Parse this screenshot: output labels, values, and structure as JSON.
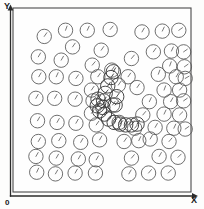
{
  "figure": {
    "title": "",
    "x_axis_label": "X",
    "y_axis_label": "Y",
    "origin_label": "0",
    "caption_partial": "",
    "colors": {
      "frame_stroke": "#4a4a4a",
      "axis_stroke": "#2b2b2b",
      "marker_stroke": "#555555",
      "cluster_stroke": "#3d3d3d",
      "background": "#fefefe"
    }
  },
  "chart_data": {
    "type": "scatter",
    "title": "",
    "xlabel": "X",
    "ylabel": "Y",
    "xlim": [
      0,
      100
    ],
    "ylim": [
      0,
      100
    ],
    "grid": false,
    "legend": null,
    "marker": "circle-with-orientation-hand",
    "marker_radius_px": 7.2,
    "points": [
      {
        "x": 13.9,
        "y": 88.3,
        "angle": 35
      },
      {
        "x": 27.2,
        "y": 92.0,
        "angle": 20
      },
      {
        "x": 40.8,
        "y": 92.0,
        "angle": 25
      },
      {
        "x": 55.1,
        "y": 92.5,
        "angle": 40
      },
      {
        "x": 75.0,
        "y": 91.0,
        "angle": 30
      },
      {
        "x": 87.7,
        "y": 91.5,
        "angle": 25
      },
      {
        "x": 98.0,
        "y": 92.0,
        "angle": 55
      },
      {
        "x": 31.6,
        "y": 82.0,
        "angle": 35
      },
      {
        "x": 49.5,
        "y": 80.0,
        "angle": 35
      },
      {
        "x": 10.2,
        "y": 76.0,
        "angle": 30
      },
      {
        "x": 24.5,
        "y": 74.0,
        "angle": 30
      },
      {
        "x": 43.9,
        "y": 71.0,
        "angle": 40
      },
      {
        "x": 82.1,
        "y": 79.0,
        "angle": 35
      },
      {
        "x": 93.4,
        "y": 79.5,
        "angle": 25
      },
      {
        "x": 101.0,
        "y": 79.0,
        "angle": 55
      },
      {
        "x": 68.4,
        "y": 75.0,
        "angle": 40
      },
      {
        "x": 92.3,
        "y": 70.5,
        "angle": 20
      },
      {
        "x": 101.5,
        "y": 70.0,
        "angle": 55
      },
      {
        "x": 10.5,
        "y": 64.0,
        "angle": 30
      },
      {
        "x": 21.4,
        "y": 64.0,
        "angle": 25
      },
      {
        "x": 33.7,
        "y": 63.0,
        "angle": 35
      },
      {
        "x": 47.4,
        "y": 64.0,
        "angle": 35
      },
      {
        "x": 66.3,
        "y": 64.0,
        "angle": 35
      },
      {
        "x": 85.2,
        "y": 65.5,
        "angle": 20
      },
      {
        "x": 96.4,
        "y": 64.0,
        "angle": 30
      },
      {
        "x": 102.0,
        "y": 63.0,
        "angle": 60
      },
      {
        "x": 43.4,
        "y": 56.0,
        "angle": 35
      },
      {
        "x": 71.9,
        "y": 57.5,
        "angle": 35
      },
      {
        "x": 88.8,
        "y": 56.0,
        "angle": 20
      },
      {
        "x": 98.5,
        "y": 56.0,
        "angle": 40
      },
      {
        "x": 8.7,
        "y": 51.0,
        "angle": 30
      },
      {
        "x": 20.4,
        "y": 51.0,
        "angle": 30
      },
      {
        "x": 33.2,
        "y": 50.5,
        "angle": 30
      },
      {
        "x": 44.4,
        "y": 49.5,
        "angle": 35
      },
      {
        "x": 79.6,
        "y": 49.0,
        "angle": 25
      },
      {
        "x": 92.9,
        "y": 49.0,
        "angle": 30
      },
      {
        "x": 101.0,
        "y": 49.5,
        "angle": 55
      },
      {
        "x": 43.4,
        "y": 42.0,
        "angle": 35
      },
      {
        "x": 75.5,
        "y": 41.0,
        "angle": 40
      },
      {
        "x": 88.8,
        "y": 41.5,
        "angle": 25
      },
      {
        "x": 98.5,
        "y": 41.0,
        "angle": 45
      },
      {
        "x": 9.7,
        "y": 37.5,
        "angle": 30
      },
      {
        "x": 21.9,
        "y": 36.5,
        "angle": 30
      },
      {
        "x": 33.7,
        "y": 36.0,
        "angle": 30
      },
      {
        "x": 46.4,
        "y": 35.0,
        "angle": 35
      },
      {
        "x": 83.2,
        "y": 33.5,
        "angle": 30
      },
      {
        "x": 94.9,
        "y": 33.0,
        "angle": 25
      },
      {
        "x": 102.0,
        "y": 32.5,
        "angle": 55
      },
      {
        "x": 10.2,
        "y": 25.0,
        "angle": 30
      },
      {
        "x": 23.0,
        "y": 25.5,
        "angle": 30
      },
      {
        "x": 36.7,
        "y": 24.5,
        "angle": 30
      },
      {
        "x": 48.5,
        "y": 26.0,
        "angle": 30
      },
      {
        "x": 63.8,
        "y": 25.0,
        "angle": 35
      },
      {
        "x": 73.0,
        "y": 25.5,
        "angle": 25
      },
      {
        "x": 80.1,
        "y": 26.5,
        "angle": 30
      },
      {
        "x": 91.9,
        "y": 25.0,
        "angle": 40
      },
      {
        "x": 8.7,
        "y": 16.0,
        "angle": 30
      },
      {
        "x": 21.4,
        "y": 15.0,
        "angle": 30
      },
      {
        "x": 35.2,
        "y": 14.5,
        "angle": 30
      },
      {
        "x": 46.4,
        "y": 14.0,
        "angle": 30
      },
      {
        "x": 68.4,
        "y": 15.0,
        "angle": 40
      },
      {
        "x": 85.7,
        "y": 16.0,
        "angle": 30
      },
      {
        "x": 97.5,
        "y": 15.5,
        "angle": 45
      },
      {
        "x": 9.2,
        "y": 6.5,
        "angle": 25
      },
      {
        "x": 20.9,
        "y": 5.5,
        "angle": 30
      },
      {
        "x": 33.2,
        "y": 6.0,
        "angle": 30
      },
      {
        "x": 45.9,
        "y": 6.0,
        "angle": 35
      },
      {
        "x": 66.8,
        "y": 5.5,
        "angle": 30
      },
      {
        "x": 79.1,
        "y": 6.0,
        "angle": 40
      },
      {
        "x": 91.4,
        "y": 6.0,
        "angle": 45
      },
      {
        "x": 56.1,
        "y": 68.0,
        "angle": 35
      },
      {
        "x": 60.2,
        "y": 59.0,
        "angle": 35
      },
      {
        "x": 56.6,
        "y": 47.0,
        "angle": 35
      },
      {
        "x": 60.7,
        "y": 36.5,
        "angle": 30
      },
      {
        "x": 70.4,
        "y": 33.0,
        "angle": 40
      }
    ],
    "cluster": {
      "label": "dense overlapping cluster",
      "shape": "hook",
      "points": [
        {
          "x": 55.6,
          "y": 63.5,
          "angle": 35
        },
        {
          "x": 53.6,
          "y": 58.5,
          "angle": 35
        },
        {
          "x": 52.0,
          "y": 54.0,
          "angle": 40
        },
        {
          "x": 51.0,
          "y": 49.5,
          "angle": 35
        },
        {
          "x": 50.5,
          "y": 45.5,
          "angle": 40
        },
        {
          "x": 51.5,
          "y": 41.5,
          "angle": 35
        },
        {
          "x": 54.1,
          "y": 38.5,
          "angle": 40
        },
        {
          "x": 57.6,
          "y": 36.5,
          "angle": 35
        },
        {
          "x": 61.2,
          "y": 35.5,
          "angle": 40
        },
        {
          "x": 64.8,
          "y": 35.0,
          "angle": 35
        },
        {
          "x": 68.4,
          "y": 35.0,
          "angle": 40
        },
        {
          "x": 71.9,
          "y": 35.5,
          "angle": 35
        },
        {
          "x": 47.0,
          "y": 46.5,
          "angle": 40
        },
        {
          "x": 47.5,
          "y": 50.5,
          "angle": 35
        },
        {
          "x": 48.5,
          "y": 43.5,
          "angle": 40
        },
        {
          "x": 57.1,
          "y": 67.0,
          "angle": 30
        },
        {
          "x": 59.2,
          "y": 52.0,
          "angle": 35
        },
        {
          "x": 58.2,
          "y": 47.0,
          "angle": 40
        }
      ]
    }
  }
}
